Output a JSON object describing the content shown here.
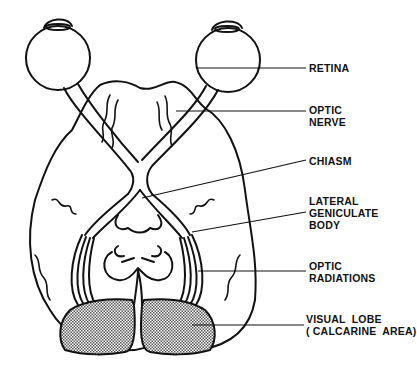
{
  "diagram": {
    "colors": {
      "stroke": "#111111",
      "shading": "#9a9a9a",
      "background": "#ffffff"
    },
    "labels": [
      {
        "id": "retina",
        "text": "RETINA",
        "x": 309,
        "y": 36,
        "line": [
          [
            196,
            68
          ],
          [
            306,
            42
          ]
        ]
      },
      {
        "id": "optic-nerve",
        "text": "OPTIC\nNERVE",
        "x": 309,
        "y": 95,
        "line": [
          [
            196,
            111
          ],
          [
            306,
            111
          ]
        ]
      },
      {
        "id": "chiasm",
        "text": "CHIASM",
        "x": 309,
        "y": 147,
        "line": [
          [
            142,
            198
          ],
          [
            306,
            153
          ]
        ]
      },
      {
        "id": "lateral-geniculate-body",
        "text": "LATERAL\nGENICULATE\nBODY",
        "x": 309,
        "y": 194,
        "line": [
          [
            192,
            232
          ],
          [
            306,
            212
          ]
        ]
      },
      {
        "id": "optic-radiations",
        "text": "OPTIC\nRADIATIONS",
        "x": 309,
        "y": 259,
        "line": [
          [
            198,
            271
          ],
          [
            306,
            271
          ]
        ]
      },
      {
        "id": "visual-lobe",
        "text": "VISUAL  LOBE\n( CALCARINE  AREA)",
        "x": 306,
        "y": 311,
        "line": [
          [
            192,
            325
          ],
          [
            304,
            325
          ]
        ]
      }
    ]
  }
}
